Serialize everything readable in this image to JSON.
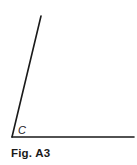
{
  "figure": {
    "vertex_label": "C",
    "caption": "Fig. A3",
    "line_color": "#1a1a1a",
    "vertex": {
      "x": 12,
      "y": 137
    },
    "ray_slanted_end": {
      "x": 41,
      "y": 16
    },
    "ray_horizontal_end": {
      "x": 134,
      "y": 137
    }
  }
}
